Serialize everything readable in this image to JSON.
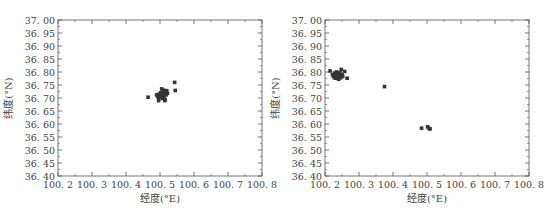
{
  "chart_data": [
    {
      "type": "scatter",
      "panel": "left",
      "title": "",
      "xlabel": "经度(°E)",
      "ylabel": "纬度(°N)",
      "xlim": [
        100.2,
        100.8
      ],
      "ylim": [
        36.4,
        37.0
      ],
      "xticks": [
        "100.2",
        "100.3",
        "100.4",
        "100.5",
        "100.6",
        "100.7",
        "100.8"
      ],
      "yticks": [
        "36.40",
        "36.45",
        "36.50",
        "36.55",
        "36.60",
        "36.65",
        "36.70",
        "36.75",
        "36.80",
        "36.85",
        "36.90",
        "36.95",
        "37.00"
      ],
      "grid": false,
      "legend": null,
      "marker": "square",
      "color": "#333333",
      "points": [
        {
          "x": 100.465,
          "y": 36.703
        },
        {
          "x": 100.49,
          "y": 36.712
        },
        {
          "x": 100.493,
          "y": 36.706
        },
        {
          "x": 100.496,
          "y": 36.7
        },
        {
          "x": 100.498,
          "y": 36.715
        },
        {
          "x": 100.5,
          "y": 36.71
        },
        {
          "x": 100.502,
          "y": 36.72
        },
        {
          "x": 100.503,
          "y": 36.705
        },
        {
          "x": 100.505,
          "y": 36.735
        },
        {
          "x": 100.506,
          "y": 36.712
        },
        {
          "x": 100.507,
          "y": 36.698
        },
        {
          "x": 100.508,
          "y": 36.724
        },
        {
          "x": 100.51,
          "y": 36.716
        },
        {
          "x": 100.511,
          "y": 36.73
        },
        {
          "x": 100.512,
          "y": 36.707
        },
        {
          "x": 100.514,
          "y": 36.69
        },
        {
          "x": 100.516,
          "y": 36.722
        },
        {
          "x": 100.518,
          "y": 36.712
        },
        {
          "x": 100.52,
          "y": 36.728
        },
        {
          "x": 100.522,
          "y": 36.718
        },
        {
          "x": 100.496,
          "y": 36.69
        },
        {
          "x": 100.515,
          "y": 36.694
        },
        {
          "x": 100.543,
          "y": 36.76
        },
        {
          "x": 100.545,
          "y": 36.729
        }
      ]
    },
    {
      "type": "scatter",
      "panel": "right",
      "title": "",
      "xlabel": "经度(°E)",
      "ylabel": "纬度(°N)",
      "xlim": [
        100.2,
        100.8
      ],
      "ylim": [
        36.4,
        37.0
      ],
      "xticks": [
        "100.2",
        "100.3",
        "100.4",
        "100.5",
        "100.6",
        "100.7",
        "100.8"
      ],
      "yticks": [
        "36.40",
        "36.45",
        "36.50",
        "36.55",
        "36.60",
        "36.65",
        "36.70",
        "36.75",
        "36.80",
        "36.85",
        "36.90",
        "36.95",
        "37.00"
      ],
      "grid": false,
      "legend": null,
      "marker": "square",
      "color": "#333333",
      "points": [
        {
          "x": 100.215,
          "y": 36.804
        },
        {
          "x": 100.222,
          "y": 36.79
        },
        {
          "x": 100.225,
          "y": 36.782
        },
        {
          "x": 100.228,
          "y": 36.796
        },
        {
          "x": 100.23,
          "y": 36.776
        },
        {
          "x": 100.232,
          "y": 36.788
        },
        {
          "x": 100.234,
          "y": 36.8
        },
        {
          "x": 100.236,
          "y": 36.78
        },
        {
          "x": 100.238,
          "y": 36.792
        },
        {
          "x": 100.24,
          "y": 36.772
        },
        {
          "x": 100.242,
          "y": 36.786
        },
        {
          "x": 100.244,
          "y": 36.798
        },
        {
          "x": 100.246,
          "y": 36.778
        },
        {
          "x": 100.248,
          "y": 36.81
        },
        {
          "x": 100.25,
          "y": 36.79
        },
        {
          "x": 100.252,
          "y": 36.783
        },
        {
          "x": 100.258,
          "y": 36.802
        },
        {
          "x": 100.265,
          "y": 36.776
        },
        {
          "x": 100.375,
          "y": 36.744
        },
        {
          "x": 100.484,
          "y": 36.584
        },
        {
          "x": 100.502,
          "y": 36.589
        },
        {
          "x": 100.506,
          "y": 36.583
        },
        {
          "x": 100.509,
          "y": 36.581
        }
      ]
    }
  ]
}
